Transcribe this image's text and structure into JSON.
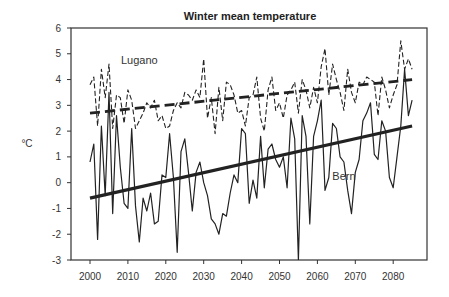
{
  "chart_data": {
    "type": "line",
    "title": "Winter mean temperature",
    "xlabel": "",
    "ylabel": "°C",
    "xlim": [
      1997,
      2088
    ],
    "ylim": [
      -3,
      6
    ],
    "x_ticks": [
      2000,
      2010,
      2020,
      2030,
      2040,
      2050,
      2060,
      2070,
      2080
    ],
    "y_ticks": [
      -3,
      -2,
      -1,
      0,
      1,
      2,
      3,
      4,
      5,
      6
    ],
    "grid": false,
    "legend": "inline labels",
    "annotations": [
      {
        "text": "Lugano",
        "x": 2013,
        "y": 4.6
      },
      {
        "text": "Bern",
        "x": 2067,
        "y": 0.1
      }
    ],
    "x": [
      2000,
      2001,
      2002,
      2003,
      2004,
      2005,
      2006,
      2007,
      2008,
      2009,
      2010,
      2011,
      2012,
      2013,
      2014,
      2015,
      2016,
      2017,
      2018,
      2019,
      2020,
      2021,
      2022,
      2023,
      2024,
      2025,
      2026,
      2027,
      2028,
      2029,
      2030,
      2031,
      2032,
      2033,
      2034,
      2035,
      2036,
      2037,
      2038,
      2039,
      2040,
      2041,
      2042,
      2043,
      2044,
      2045,
      2046,
      2047,
      2048,
      2049,
      2050,
      2051,
      2052,
      2053,
      2054,
      2055,
      2056,
      2057,
      2058,
      2059,
      2060,
      2061,
      2062,
      2063,
      2064,
      2065,
      2066,
      2067,
      2068,
      2069,
      2070,
      2071,
      2072,
      2073,
      2074,
      2075,
      2076,
      2077,
      2078,
      2079,
      2080,
      2081,
      2082,
      2083,
      2084,
      2085
    ],
    "series": [
      {
        "name": "Lugano",
        "style": "dashed",
        "values": [
          3.8,
          4.1,
          2.2,
          4.4,
          3.3,
          4.6,
          2.1,
          3.4,
          3.3,
          2.3,
          3.6,
          3.2,
          2.1,
          2.4,
          2.7,
          3.1,
          2.9,
          3.2,
          2.4,
          2.6,
          2.1,
          2.2,
          2.8,
          3.1,
          2.9,
          3.5,
          3.4,
          3.2,
          3.6,
          3.3,
          4.8,
          2.5,
          3.3,
          1.9,
          3.7,
          2.4,
          3.9,
          3.8,
          3.4,
          2.7,
          2.8,
          2.2,
          3.3,
          3.4,
          4.1,
          2.5,
          2.0,
          3.6,
          4.1,
          2.8,
          3.1,
          2.5,
          3.4,
          3.6,
          3.9,
          2.7,
          4.0,
          3.6,
          2.9,
          3.7,
          3.1,
          4.5,
          5.2,
          3.4,
          4.6,
          4.0,
          3.5,
          2.8,
          4.4,
          3.5,
          3.1,
          3.9,
          3.8,
          4.1,
          4.0,
          3.9,
          2.6,
          4.1,
          3.6,
          2.9,
          3.4,
          3.8,
          5.5,
          4.4,
          4.8,
          4.4
        ]
      },
      {
        "name": "Bern",
        "style": "solid",
        "values": [
          0.8,
          1.5,
          -2.2,
          2.2,
          -0.5,
          3.5,
          -1.2,
          2.6,
          0.6,
          -0.8,
          -1.0,
          2.1,
          -0.9,
          -2.3,
          -0.6,
          -1.1,
          -0.4,
          -1.6,
          -1.5,
          0.3,
          0.2,
          1.9,
          0.2,
          -2.7,
          1.2,
          1.7,
          0.4,
          -1.1,
          0.4,
          0.8,
          0.0,
          -0.5,
          -1.4,
          -1.6,
          -2.0,
          -1.2,
          -1.3,
          -0.4,
          0.3,
          0.0,
          2.1,
          1.9,
          -0.8,
          0.1,
          -0.6,
          1.8,
          -0.2,
          1.3,
          1.5,
          0.9,
          0.6,
          1.0,
          -0.2,
          2.5,
          1.7,
          -3.0,
          2.6,
          1.8,
          -1.6,
          1.8,
          2.4,
          3.2,
          -0.3,
          0.2,
          2.3,
          2.1,
          1.0,
          0.8,
          -0.3,
          -1.2,
          0.4,
          0.9,
          2.4,
          2.7,
          3.1,
          1.1,
          0.9,
          2.4,
          2.0,
          0.2,
          -0.2,
          1.0,
          2.2,
          4.4,
          2.6,
          3.2
        ]
      },
      {
        "name": "Lugano trend",
        "style": "thick-dashed",
        "x": [
          2000,
          2085
        ],
        "values": [
          2.7,
          4.0
        ]
      },
      {
        "name": "Bern trend",
        "style": "thick-solid",
        "x": [
          2000,
          2085
        ],
        "values": [
          -0.6,
          2.2
        ]
      }
    ]
  }
}
